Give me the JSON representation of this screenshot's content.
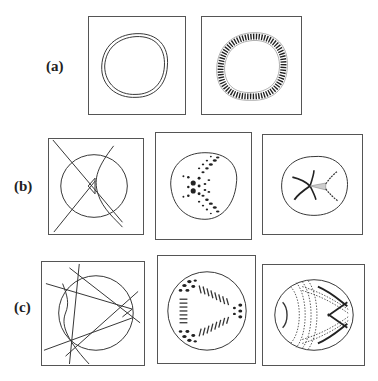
{
  "figure": {
    "rows": [
      {
        "label": "(a)",
        "panels": [
          "caustic-double-curve",
          "wave-pattern-ring"
        ]
      },
      {
        "label": "(b)",
        "panels": [
          "caustic-lines-cusp",
          "wave-pattern-dots-cross",
          "wave-pattern-cusp"
        ]
      },
      {
        "label": "(c)",
        "panels": [
          "caustic-lines-triangle",
          "wave-pattern-triangle",
          "wave-pattern-fans"
        ]
      }
    ]
  },
  "colors": {
    "ink": "#333333",
    "frame": "#555555",
    "background": "#ffffff"
  }
}
